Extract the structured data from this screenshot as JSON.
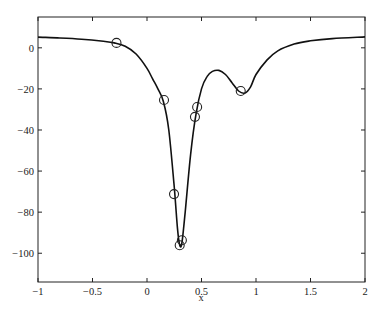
{
  "chart_data": {
    "type": "line",
    "title": "",
    "xlabel": "x",
    "ylabel": "",
    "xlim": [
      -1,
      2
    ],
    "ylim": [
      -114,
      15
    ],
    "grid": false,
    "legend": null,
    "x_ticks": [
      -1,
      -0.5,
      0,
      0.5,
      1,
      1.5,
      2
    ],
    "x_tick_labels": [
      "-1",
      "-0.5",
      "0",
      "0.5",
      "1",
      "1.5",
      "2"
    ],
    "y_ticks": [
      0,
      -20,
      -40,
      -60,
      -80,
      -100
    ],
    "y_tick_labels": [
      "0",
      "-20",
      "-40",
      "-60",
      "-80",
      "-100"
    ],
    "series": [
      {
        "name": "curve",
        "style": "solid line",
        "color": "#000000",
        "x": [
          -1.0,
          -0.8,
          -0.6,
          -0.4,
          -0.3,
          -0.2,
          -0.1,
          0.0,
          0.05,
          0.1,
          0.15,
          0.2,
          0.25,
          0.28,
          0.3,
          0.32,
          0.35,
          0.4,
          0.45,
          0.5,
          0.55,
          0.6,
          0.66,
          0.72,
          0.78,
          0.84,
          0.9,
          0.95,
          1.0,
          1.1,
          1.2,
          1.35,
          1.5,
          1.7,
          2.0
        ],
        "y": [
          5.2,
          4.8,
          4.2,
          3.2,
          2.4,
          0.8,
          -3,
          -10,
          -15,
          -20,
          -26,
          -40,
          -68,
          -88,
          -96,
          -95,
          -80,
          -52,
          -32,
          -20,
          -14,
          -11.5,
          -11,
          -13,
          -17,
          -21,
          -22,
          -19,
          -13,
          -6,
          -1.5,
          1.8,
          3.4,
          4.5,
          5.3
        ]
      },
      {
        "name": "samples",
        "style": "circle markers",
        "color": "#000000",
        "x": [
          -0.28,
          0.156,
          0.248,
          0.32,
          0.3,
          0.44,
          0.46,
          0.86
        ],
        "y": [
          2.4,
          -25.4,
          -71.2,
          -93.7,
          -96.1,
          -33.6,
          -28.8,
          -21.0
        ]
      }
    ]
  }
}
